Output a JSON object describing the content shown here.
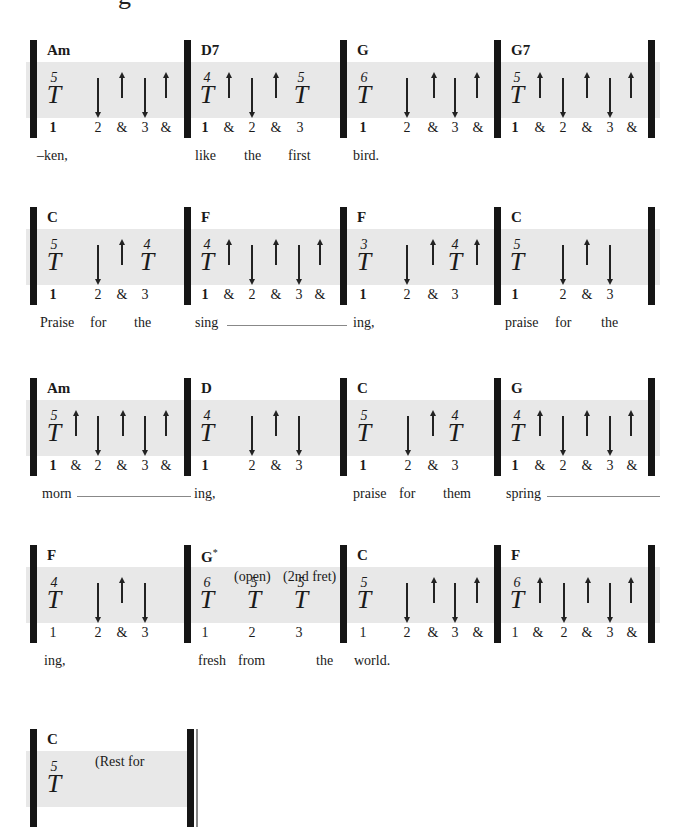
{
  "title_fragment": "g",
  "systems": [
    {
      "measures": [
        {
          "chord": "Am",
          "thumb": {
            "fret": "5",
            "symbol": "T"
          },
          "beats": [
            "1",
            "2",
            "&",
            "3",
            "&"
          ],
          "strums": [
            {
              "dir": "down",
              "beat": "2"
            },
            {
              "dir": "up",
              "beat": "&"
            },
            {
              "dir": "down",
              "beat": "3"
            },
            {
              "dir": "up",
              "beat": "&"
            }
          ]
        },
        {
          "chord": "D7",
          "thumbs": [
            {
              "fret": "4",
              "symbol": "T",
              "beat": "1"
            },
            {
              "fret": "5",
              "symbol": "T",
              "beat": "3"
            }
          ],
          "beats": [
            "1",
            "&",
            "2",
            "&",
            "3"
          ],
          "strums": [
            {
              "dir": "up",
              "beat": "&"
            },
            {
              "dir": "down",
              "beat": "2"
            },
            {
              "dir": "up",
              "beat": "&"
            }
          ]
        },
        {
          "chord": "G",
          "thumb": {
            "fret": "6",
            "symbol": "T"
          },
          "beats": [
            "1",
            "2",
            "&",
            "3",
            "&"
          ],
          "strums": [
            {
              "dir": "down",
              "beat": "2"
            },
            {
              "dir": "up",
              "beat": "&"
            },
            {
              "dir": "down",
              "beat": "3"
            },
            {
              "dir": "up",
              "beat": "&"
            }
          ]
        },
        {
          "chord": "G7",
          "thumb": {
            "fret": "5",
            "symbol": "T"
          },
          "beats": [
            "1",
            "&",
            "2",
            "&",
            "3",
            "&"
          ],
          "strums": [
            {
              "dir": "up",
              "beat": "&"
            },
            {
              "dir": "down",
              "beat": "2"
            },
            {
              "dir": "up",
              "beat": "&"
            },
            {
              "dir": "down",
              "beat": "3"
            },
            {
              "dir": "up",
              "beat": "&"
            }
          ]
        }
      ],
      "lyrics": [
        "–ken,",
        "like",
        "the",
        "first",
        "bird."
      ]
    },
    {
      "measures": [
        {
          "chord": "C",
          "thumbs": [
            {
              "fret": "5",
              "symbol": "T",
              "beat": "1"
            },
            {
              "fret": "4",
              "symbol": "T",
              "beat": "3"
            }
          ],
          "beats": [
            "1",
            "2",
            "&",
            "3"
          ],
          "strums": [
            {
              "dir": "down",
              "beat": "2"
            },
            {
              "dir": "up",
              "beat": "&"
            }
          ]
        },
        {
          "chord": "F",
          "thumb": {
            "fret": "4",
            "symbol": "T"
          },
          "beats": [
            "1",
            "&",
            "2",
            "&",
            "3",
            "&"
          ],
          "strums": [
            {
              "dir": "up",
              "beat": "&"
            },
            {
              "dir": "down",
              "beat": "2"
            },
            {
              "dir": "up",
              "beat": "&"
            },
            {
              "dir": "down",
              "beat": "3"
            },
            {
              "dir": "up",
              "beat": "&"
            }
          ]
        },
        {
          "chord": "F",
          "thumbs": [
            {
              "fret": "3",
              "symbol": "T",
              "beat": "1"
            },
            {
              "fret": "4",
              "symbol": "T",
              "beat": "3"
            }
          ],
          "beats": [
            "1",
            "2",
            "&",
            "3"
          ],
          "strums": [
            {
              "dir": "down",
              "beat": "2"
            },
            {
              "dir": "up",
              "beat": "&"
            },
            {
              "dir": "up",
              "beat": "after-3"
            }
          ]
        },
        {
          "chord": "C",
          "thumb": {
            "fret": "5",
            "symbol": "T"
          },
          "beats": [
            "1",
            "2",
            "&",
            "3"
          ],
          "strums": [
            {
              "dir": "down",
              "beat": "2"
            },
            {
              "dir": "up",
              "beat": "&"
            },
            {
              "dir": "down",
              "beat": "3"
            }
          ]
        }
      ],
      "lyrics": [
        "Praise",
        "for",
        "the",
        "sing",
        "ing,",
        "praise",
        "for",
        "the"
      ]
    },
    {
      "measures": [
        {
          "chord": "Am",
          "thumb": {
            "fret": "5",
            "symbol": "T"
          },
          "beats": [
            "1",
            "&",
            "2",
            "&",
            "3",
            "&"
          ],
          "strums": [
            {
              "dir": "up",
              "beat": "&"
            },
            {
              "dir": "down",
              "beat": "2"
            },
            {
              "dir": "up",
              "beat": "&"
            },
            {
              "dir": "down",
              "beat": "3"
            },
            {
              "dir": "up",
              "beat": "&"
            }
          ]
        },
        {
          "chord": "D",
          "thumb": {
            "fret": "4",
            "symbol": "T"
          },
          "beats": [
            "1",
            "2",
            "&",
            "3"
          ],
          "strums": [
            {
              "dir": "down",
              "beat": "2"
            },
            {
              "dir": "up",
              "beat": "&"
            },
            {
              "dir": "down",
              "beat": "3"
            }
          ]
        },
        {
          "chord": "C",
          "thumbs": [
            {
              "fret": "5",
              "symbol": "T",
              "beat": "1"
            },
            {
              "fret": "4",
              "symbol": "T",
              "beat": "3"
            }
          ],
          "beats": [
            "1",
            "2",
            "&",
            "3"
          ],
          "strums": [
            {
              "dir": "down",
              "beat": "2"
            },
            {
              "dir": "up",
              "beat": "&"
            }
          ]
        },
        {
          "chord": "G",
          "thumb": {
            "fret": "4",
            "symbol": "T"
          },
          "beats": [
            "1",
            "&",
            "2",
            "&",
            "3",
            "&"
          ],
          "strums": [
            {
              "dir": "up",
              "beat": "&"
            },
            {
              "dir": "down",
              "beat": "2"
            },
            {
              "dir": "up",
              "beat": "&"
            },
            {
              "dir": "down",
              "beat": "3"
            },
            {
              "dir": "up",
              "beat": "&"
            }
          ]
        }
      ],
      "lyrics": [
        "morn",
        "ing,",
        "praise",
        "for",
        "them",
        "spring"
      ]
    },
    {
      "measures": [
        {
          "chord": "F",
          "thumb": {
            "fret": "4",
            "symbol": "T"
          },
          "beats": [
            "1",
            "2",
            "&",
            "3"
          ],
          "strums": [
            {
              "dir": "down",
              "beat": "2"
            },
            {
              "dir": "up",
              "beat": "&"
            },
            {
              "dir": "down",
              "beat": "3"
            }
          ]
        },
        {
          "chord": "G",
          "chord_mark": "*",
          "annotations": [
            "(open)",
            "(2nd fret)"
          ],
          "thumbs": [
            {
              "fret": "6",
              "symbol": "T",
              "beat": "1"
            },
            {
              "fret": "5",
              "symbol": "T",
              "beat": "2"
            },
            {
              "fret": "5",
              "symbol": "T",
              "beat": "3"
            }
          ],
          "beats": [
            "1",
            "2",
            "3"
          ],
          "strums": []
        },
        {
          "chord": "C",
          "thumb": {
            "fret": "5",
            "symbol": "T"
          },
          "beats": [
            "1",
            "2",
            "&",
            "3",
            "&"
          ],
          "strums": [
            {
              "dir": "down",
              "beat": "2"
            },
            {
              "dir": "up",
              "beat": "&"
            },
            {
              "dir": "down",
              "beat": "3"
            },
            {
              "dir": "up",
              "beat": "&"
            }
          ]
        },
        {
          "chord": "F",
          "thumb": {
            "fret": "6",
            "symbol": "T"
          },
          "beats": [
            "1",
            "&",
            "2",
            "&",
            "3",
            "&"
          ],
          "strums": [
            {
              "dir": "up",
              "beat": "&"
            },
            {
              "dir": "down",
              "beat": "2"
            },
            {
              "dir": "up",
              "beat": "&"
            },
            {
              "dir": "down",
              "beat": "3"
            },
            {
              "dir": "up",
              "beat": "&"
            }
          ]
        }
      ],
      "lyrics": [
        "ing,",
        "fresh",
        "from",
        "the",
        "world."
      ]
    },
    {
      "measures": [
        {
          "chord": "C",
          "thumb": {
            "fret": "5",
            "symbol": "T"
          },
          "annotation": "(Rest for"
        }
      ]
    }
  ]
}
